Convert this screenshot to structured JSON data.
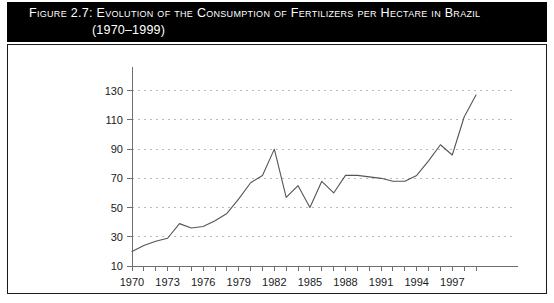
{
  "figure": {
    "title_line1": "Figure 2.7:  Evolution of the Consumption of Fertilizers per Hectare in Brazil",
    "title_line2": "(1970–1999)",
    "banner_color": "#000000",
    "banner_text_color": "#ffffff",
    "frame_color": "#1a1a1a",
    "background": "#ffffff"
  },
  "chart_data": {
    "type": "line",
    "title": "Evolution of the Consumption of Fertilizers per Hectare in Brazil (1970–1999)",
    "xlabel": "",
    "ylabel": "",
    "xlim": [
      1970,
      1999
    ],
    "ylim": [
      10,
      138
    ],
    "grid": "horizontal-dashed",
    "legend": "none",
    "line_color": "#555555",
    "grid_color": "#b9b9b9",
    "axis_color": "#6e6e6e",
    "ytick_values": [
      10,
      30,
      50,
      70,
      90,
      110,
      130
    ],
    "ytick_labels": [
      "10",
      "30",
      "50",
      "70",
      "90",
      "110",
      "130"
    ],
    "xtick_values": [
      1970,
      1973,
      1976,
      1979,
      1982,
      1985,
      1988,
      1991,
      1994,
      1997
    ],
    "xtick_labels": [
      "1970",
      "1973",
      "1976",
      "1979",
      "1982",
      "1985",
      "1988",
      "1991",
      "1994",
      "1997"
    ],
    "xminor_step": 1,
    "x": [
      1970,
      1971,
      1972,
      1973,
      1974,
      1975,
      1976,
      1977,
      1978,
      1979,
      1980,
      1981,
      1982,
      1983,
      1984,
      1985,
      1986,
      1987,
      1988,
      1989,
      1990,
      1991,
      1992,
      1993,
      1994,
      1995,
      1996,
      1997,
      1998,
      1999
    ],
    "values": [
      20,
      24,
      27,
      29,
      39,
      36,
      37,
      41,
      46,
      56,
      67,
      72,
      90,
      57,
      65,
      50,
      68,
      60,
      72,
      72,
      71,
      70,
      68,
      68,
      72,
      82,
      93,
      86,
      112,
      127
    ],
    "series": [
      {
        "name": "Fertilizer consumption per hectare",
        "values": [
          20,
          24,
          27,
          29,
          39,
          36,
          37,
          41,
          46,
          56,
          67,
          72,
          90,
          57,
          65,
          50,
          68,
          60,
          72,
          72,
          71,
          70,
          68,
          68,
          72,
          82,
          93,
          86,
          112,
          127
        ]
      }
    ]
  }
}
